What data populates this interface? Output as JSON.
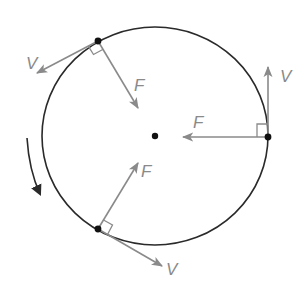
{
  "diagram": {
    "colors": {
      "circle": "#2a2a2a",
      "vector": "#8a8a8a",
      "label": "#8a8a8a",
      "point": "#111111",
      "background": "#ffffff"
    },
    "circle": {
      "cx": 155,
      "cy": 136,
      "rx": 113,
      "ry": 109
    },
    "center_point": {
      "x": 155,
      "y": 136
    },
    "rotation_direction": "counterclockwise",
    "points": [
      {
        "id": "top-left",
        "x": 98,
        "y": 41,
        "velocity": {
          "label": "V",
          "to": [
            37,
            73
          ]
        },
        "force": {
          "label": "F",
          "to": [
            138,
            108
          ]
        }
      },
      {
        "id": "right",
        "x": 268,
        "y": 137,
        "velocity": {
          "label": "V",
          "to": [
            268,
            67
          ]
        },
        "force": {
          "label": "F",
          "to": [
            183,
            137
          ]
        }
      },
      {
        "id": "bottom-left",
        "x": 98,
        "y": 229,
        "velocity": {
          "label": "V",
          "to": [
            162,
            266
          ]
        },
        "force": {
          "label": "F",
          "to": [
            138,
            163
          ]
        }
      }
    ],
    "labels": {
      "v_top_left": "V",
      "f_top_left": "F",
      "v_right": "V",
      "f_right": "F",
      "v_bottom": "V",
      "f_bottom": "F"
    }
  }
}
